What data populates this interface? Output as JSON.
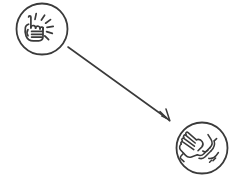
{
  "canvas": {
    "width": 244,
    "height": 184,
    "background_color": "#ffffff",
    "stroke_color": "#3a3a3a",
    "title": "Pointing hand to clasped hands diagram"
  },
  "diagram": {
    "type": "flow",
    "direction": "top-left to bottom-right",
    "nodes": [
      {
        "id": "node-pointing-hand",
        "icon_name": "pointing-hand-icon",
        "description": "Circle containing a hand with index finger pointing upward and radiating emphasis lines",
        "label": "",
        "cx": 42,
        "cy": 29,
        "r": 25.5,
        "stroke_width": 1.8,
        "fill": "#ffffff",
        "stroke": "#3a3a3a"
      },
      {
        "id": "node-clasped-hands",
        "icon_name": "clasped-hands-icon",
        "description": "Circle containing two hands clasped together in a handshake",
        "label": "",
        "cx": 202,
        "cy": 148,
        "r": 25.5,
        "stroke_width": 1.8,
        "fill": "#ffffff",
        "stroke": "#3a3a3a"
      }
    ],
    "connectors": [
      {
        "id": "connector-arrow",
        "icon_name": "arrow-down-right-icon",
        "from": "node-pointing-hand",
        "to": "node-clasped-hands",
        "x1": 68,
        "y1": 47,
        "x2": 169,
        "y2": 120,
        "stroke_width": 1.6,
        "stroke": "#3a3a3a",
        "head_style": "open-double-chevron",
        "label": ""
      }
    ]
  }
}
